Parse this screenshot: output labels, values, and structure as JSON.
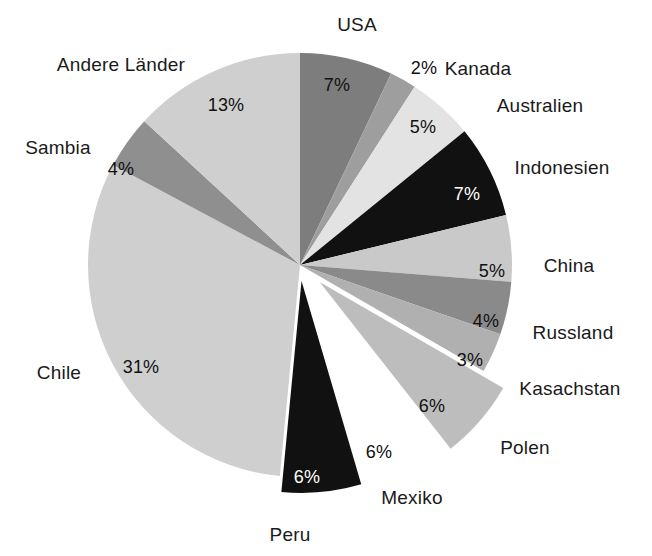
{
  "chart_data": {
    "type": "pie",
    "title": "",
    "subtitle": "",
    "xlabel": "",
    "ylabel": "",
    "legend_position": "none",
    "grid": false,
    "units": "percent",
    "categories": [
      "USA",
      "Kanada",
      "Australien",
      "Indonesien",
      "China",
      "Russland",
      "Kasachstan",
      "Polen",
      "Mexiko",
      "Peru",
      "Chile",
      "Sambia",
      "Andere Länder"
    ],
    "values": [
      7,
      2,
      5,
      7,
      5,
      4,
      3,
      6,
      6,
      6,
      31,
      4,
      13
    ],
    "value_labels": [
      "7%",
      "2%",
      "5%",
      "7%",
      "5%",
      "4%",
      "3%",
      "6%",
      "6%",
      "6%",
      "31%",
      "4%",
      "13%"
    ],
    "colors": [
      "#7d7d7d",
      "#9e9e9e",
      "#e3e3e3",
      "#111111",
      "#c9c9c9",
      "#8a8a8a",
      "#b0b0b0",
      "#bdbdbd",
      "#ffffff",
      "#111111",
      "#cfcfcf",
      "#8f8f8f",
      "#cfcfcf"
    ],
    "exploded": [
      "Polen",
      "Mexiko",
      "Peru"
    ],
    "start_angle_deg": 0,
    "direction": "clockwise"
  },
  "slices": [
    {
      "name": "USA",
      "pct": "7%",
      "color": "#7d7d7d",
      "pct_color": "dark",
      "explode": 0
    },
    {
      "name": "Kanada",
      "pct": "2%",
      "color": "#9e9e9e",
      "pct_color": "dark",
      "explode": 0
    },
    {
      "name": "Australien",
      "pct": "5%",
      "color": "#e3e3e3",
      "pct_color": "dark",
      "explode": 0
    },
    {
      "name": "Indonesien",
      "pct": "7%",
      "color": "#111111",
      "pct_color": "light",
      "explode": 0
    },
    {
      "name": "China",
      "pct": "5%",
      "color": "#c9c9c9",
      "pct_color": "dark",
      "explode": 0
    },
    {
      "name": "Russland",
      "pct": "4%",
      "color": "#8a8a8a",
      "pct_color": "dark",
      "explode": 0
    },
    {
      "name": "Kasachstan",
      "pct": "3%",
      "color": "#b0b0b0",
      "pct_color": "dark",
      "explode": 0
    },
    {
      "name": "Polen",
      "pct": "6%",
      "color": "#bdbdbd",
      "pct_color": "dark",
      "explode": 26
    },
    {
      "name": "Mexiko",
      "pct": "6%",
      "color": "#ffffff",
      "pct_color": "dark",
      "explode": 22
    },
    {
      "name": "Peru",
      "pct": "6%",
      "color": "#111111",
      "pct_color": "light",
      "explode": 16
    },
    {
      "name": "Chile",
      "pct": "31%",
      "color": "#cfcfcf",
      "pct_color": "dark",
      "explode": 0
    },
    {
      "name": "Sambia",
      "pct": "4%",
      "color": "#8f8f8f",
      "pct_color": "dark",
      "explode": 0
    },
    {
      "name": "Andere Länder",
      "pct": "13%",
      "color": "#cfcfcf",
      "pct_color": "dark",
      "explode": 0
    }
  ],
  "category_label_positions": [
    {
      "name": "USA",
      "x": 357,
      "y": 24,
      "align": "center"
    },
    {
      "name": "Kanada",
      "x": 478,
      "y": 68,
      "align": "center"
    },
    {
      "name": "Australien",
      "x": 540,
      "y": 105,
      "align": "center"
    },
    {
      "name": "Indonesien",
      "x": 562,
      "y": 167,
      "align": "center"
    },
    {
      "name": "China",
      "x": 569,
      "y": 265,
      "align": "center"
    },
    {
      "name": "Russland",
      "x": 573,
      "y": 332,
      "align": "center"
    },
    {
      "name": "Kasachstan",
      "x": 570,
      "y": 388,
      "align": "center"
    },
    {
      "name": "Polen",
      "x": 525,
      "y": 447,
      "align": "center"
    },
    {
      "name": "Mexiko",
      "x": 412,
      "y": 497,
      "align": "center"
    },
    {
      "name": "Peru",
      "x": 290,
      "y": 534,
      "align": "center"
    },
    {
      "name": "Chile",
      "x": 59,
      "y": 372,
      "align": "center"
    },
    {
      "name": "Sambia",
      "x": 58,
      "y": 147,
      "align": "center"
    },
    {
      "name": "Andere Länder",
      "x": 121,
      "y": 64,
      "align": "center"
    }
  ],
  "percent_label_positions": [
    {
      "name": "USA",
      "x": 337,
      "y": 85
    },
    {
      "name": "Kanada",
      "x": 424,
      "y": 68
    },
    {
      "name": "Australien",
      "x": 423,
      "y": 127
    },
    {
      "name": "Indonesien",
      "x": 467,
      "y": 194
    },
    {
      "name": "China",
      "x": 492,
      "y": 271
    },
    {
      "name": "Russland",
      "x": 486,
      "y": 321
    },
    {
      "name": "Kasachstan",
      "x": 470,
      "y": 360
    },
    {
      "name": "Polen",
      "x": 432,
      "y": 406
    },
    {
      "name": "Mexiko",
      "x": 379,
      "y": 452
    },
    {
      "name": "Peru",
      "x": 307,
      "y": 477
    },
    {
      "name": "Chile",
      "x": 141,
      "y": 367
    },
    {
      "name": "Sambia",
      "x": 121,
      "y": 169
    },
    {
      "name": "Andere Länder",
      "x": 226,
      "y": 105
    }
  ],
  "geometry": {
    "cx": 300,
    "cy": 265,
    "r": 212
  }
}
